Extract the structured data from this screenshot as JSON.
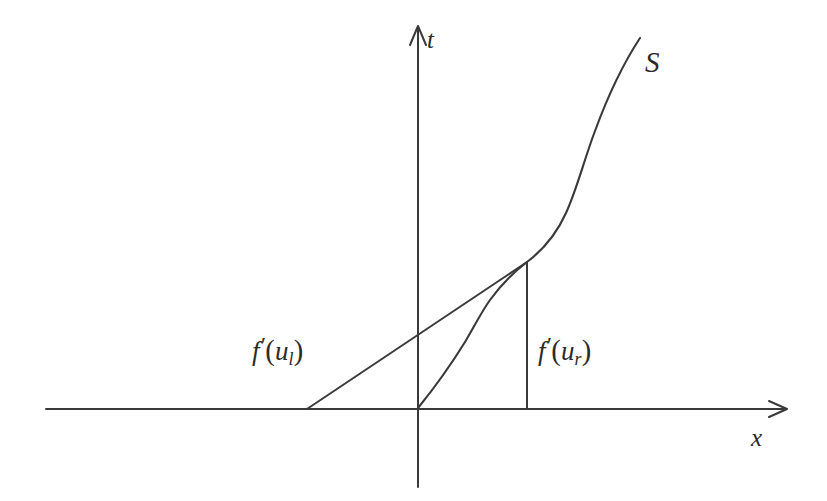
{
  "figure": {
    "background_color": "#ffffff",
    "stroke_color": "#3a3a3a",
    "width": 827,
    "height": 501
  },
  "axes": {
    "vertical": {
      "label": "t",
      "name": "t-axis",
      "x": 418,
      "y_top": 26,
      "y_bottom": 487,
      "arrow": "up"
    },
    "horizontal": {
      "label": "x",
      "name": "x-axis",
      "y": 409,
      "x_left": 46,
      "x_right": 787,
      "arrow": "right"
    },
    "origin": {
      "x": 418,
      "y": 408
    }
  },
  "curves": {
    "shock": {
      "label": "S",
      "label_x": 655,
      "label_y": 68,
      "start": {
        "x": 418,
        "y": 408
      },
      "junction": {
        "x": 527,
        "y": 262
      },
      "end": {
        "x": 640,
        "y": 38
      }
    },
    "left_characteristic": {
      "start": {
        "x": 307,
        "y": 409
      },
      "end": {
        "x": 527,
        "y": 262
      }
    },
    "right_characteristic": {
      "start": {
        "x": 527,
        "y": 409
      },
      "end": {
        "x": 527,
        "y": 262
      }
    }
  },
  "labels": {
    "left_speed": {
      "text": "f'(u_l)",
      "f": "f",
      "prime": "′",
      "open": "(",
      "var": "u",
      "sub": "l",
      "close": ")"
    },
    "right_speed": {
      "text": "f'(u_r)",
      "f": "f",
      "prime": "′",
      "open": "(",
      "var": "u",
      "sub": "r",
      "close": ")"
    },
    "axis_t": "t",
    "axis_x": "x",
    "curve_s": "S"
  }
}
